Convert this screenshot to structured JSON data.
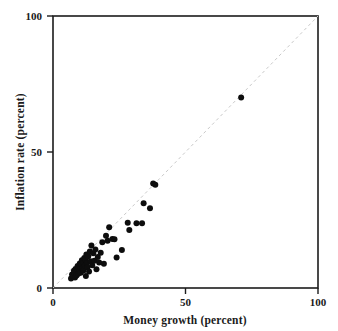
{
  "chart_data": {
    "type": "scatter",
    "title": "",
    "xlabel": "Money growth (percent)",
    "ylabel": "Inflation rate (percent)",
    "xlim": [
      0,
      100
    ],
    "ylim": [
      0,
      100
    ],
    "xticks": [
      0,
      50,
      100
    ],
    "yticks": [
      0,
      50,
      100
    ],
    "xtick_labels": [
      "0",
      "50",
      "100"
    ],
    "ytick_labels": [
      "0",
      "50",
      "100"
    ],
    "grid": false,
    "legend": null,
    "annotations": [],
    "reference_line": {
      "name": "45-degree line",
      "style": "dashed",
      "color": "#c9c9c9",
      "from": [
        0,
        0
      ],
      "to": [
        100,
        100
      ]
    },
    "marker": {
      "shape": "circle",
      "color": "#0d0d0d",
      "size": 3.0
    },
    "points": [
      [
        6.8,
        3.5
      ],
      [
        7.2,
        5.0
      ],
      [
        7.6,
        4.2
      ],
      [
        7.9,
        6.3
      ],
      [
        8.1,
        5.5
      ],
      [
        8.3,
        3.9
      ],
      [
        8.5,
        7.0
      ],
      [
        8.7,
        5.8
      ],
      [
        8.9,
        4.6
      ],
      [
        9.1,
        6.8
      ],
      [
        9.3,
        8.1
      ],
      [
        9.5,
        5.2
      ],
      [
        9.7,
        7.4
      ],
      [
        9.9,
        6.0
      ],
      [
        10.1,
        9.0
      ],
      [
        10.3,
        7.8
      ],
      [
        10.5,
        5.6
      ],
      [
        10.7,
        8.6
      ],
      [
        10.9,
        10.2
      ],
      [
        11.1,
        7.2
      ],
      [
        11.3,
        9.6
      ],
      [
        11.5,
        6.4
      ],
      [
        11.8,
        11.0
      ],
      [
        12.0,
        8.3
      ],
      [
        12.2,
        10.5
      ],
      [
        12.4,
        4.4
      ],
      [
        12.6,
        12.3
      ],
      [
        12.8,
        9.2
      ],
      [
        13.0,
        7.6
      ],
      [
        13.3,
        11.7
      ],
      [
        13.6,
        6.1
      ],
      [
        13.9,
        13.4
      ],
      [
        14.2,
        9.8
      ],
      [
        14.5,
        15.6
      ],
      [
        14.8,
        8.4
      ],
      [
        15.2,
        12.8
      ],
      [
        15.6,
        10.0
      ],
      [
        16.0,
        14.2
      ],
      [
        16.4,
        6.9
      ],
      [
        16.9,
        11.4
      ],
      [
        17.4,
        9.4
      ],
      [
        18.0,
        13.0
      ],
      [
        18.6,
        16.8
      ],
      [
        19.2,
        8.9
      ],
      [
        20.0,
        19.2
      ],
      [
        20.6,
        17.4
      ],
      [
        21.2,
        22.3
      ],
      [
        22.4,
        18.0
      ],
      [
        23.2,
        17.9
      ],
      [
        24.0,
        11.2
      ],
      [
        26.0,
        14.0
      ],
      [
        28.2,
        24.0
      ],
      [
        28.8,
        21.3
      ],
      [
        31.5,
        23.8
      ],
      [
        33.6,
        23.8
      ],
      [
        34.2,
        31.2
      ],
      [
        36.6,
        29.3
      ],
      [
        37.8,
        38.4
      ],
      [
        38.6,
        38.0
      ],
      [
        71.0,
        70.0
      ]
    ]
  },
  "layout": {
    "plot_left_px": 53,
    "plot_right_px": 318,
    "plot_top_px": 16,
    "plot_bottom_px": 288
  }
}
